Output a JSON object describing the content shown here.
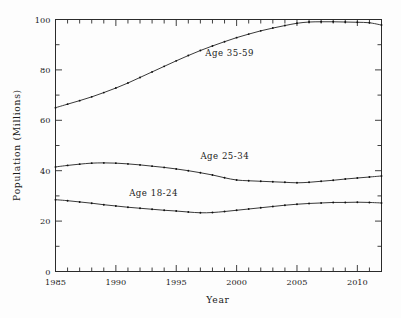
{
  "chart_data": {
    "type": "line",
    "title": "",
    "xlabel": "Year",
    "ylabel": "Population (Millions)",
    "xlim": [
      1985,
      2012
    ],
    "ylim": [
      0,
      100
    ],
    "grid": false,
    "legend_position": "inline-annotations",
    "x_ticks_major": [
      1985,
      1990,
      1995,
      2000,
      2005,
      2010
    ],
    "x_ticks_major_labels": [
      "1985",
      "1990",
      "1995",
      "2000",
      "2005",
      "2010"
    ],
    "x_ticks_minor_step": 1,
    "y_ticks_major": [
      0,
      20,
      40,
      60,
      80,
      100
    ],
    "y_ticks_major_labels": [
      "0",
      "20",
      "40",
      "60",
      "80",
      "100"
    ],
    "x": [
      1985,
      1986,
      1987,
      1988,
      1989,
      1990,
      1991,
      1992,
      1993,
      1994,
      1995,
      1996,
      1997,
      1998,
      1999,
      2000,
      2001,
      2002,
      2003,
      2004,
      2005,
      2006,
      2007,
      2008,
      2009,
      2010,
      2011,
      2012
    ],
    "series": [
      {
        "name": "Age 35-59",
        "label": "Age 35-59",
        "label_x": 1997.4,
        "label_y": 85.5,
        "color": "#222222",
        "marker": "dot",
        "values": [
          65.0,
          66.4,
          67.8,
          69.3,
          71.0,
          72.8,
          74.8,
          77.0,
          79.2,
          81.4,
          83.6,
          85.7,
          87.7,
          89.5,
          91.2,
          92.8,
          94.2,
          95.5,
          96.6,
          97.6,
          98.5,
          99.0,
          99.1,
          99.1,
          99.0,
          98.9,
          98.7,
          97.8
        ]
      },
      {
        "name": "Age 25-34",
        "label": "Age 25-34",
        "label_x": 1997.0,
        "label_y": 44.5,
        "color": "#222222",
        "marker": "dot",
        "values": [
          41.5,
          42.1,
          42.6,
          43.0,
          43.1,
          43.0,
          42.7,
          42.3,
          41.8,
          41.3,
          40.7,
          40.0,
          39.2,
          38.3,
          37.2,
          36.3,
          36.0,
          35.8,
          35.6,
          35.4,
          35.2,
          35.4,
          35.8,
          36.2,
          36.7,
          37.1,
          37.5,
          37.9
        ]
      },
      {
        "name": "Age 18-24",
        "label": "Age 18-24",
        "label_x": 1991.1,
        "label_y": 29.8,
        "color": "#222222",
        "marker": "dot",
        "values": [
          28.5,
          28.1,
          27.6,
          27.1,
          26.5,
          26.0,
          25.5,
          25.1,
          24.7,
          24.3,
          24.0,
          23.6,
          23.3,
          23.4,
          23.8,
          24.3,
          24.8,
          25.3,
          25.8,
          26.3,
          26.7,
          27.0,
          27.2,
          27.4,
          27.4,
          27.5,
          27.4,
          27.2
        ]
      }
    ]
  },
  "axes": {
    "y_title": "Population (Millions)",
    "x_title": "Year"
  }
}
